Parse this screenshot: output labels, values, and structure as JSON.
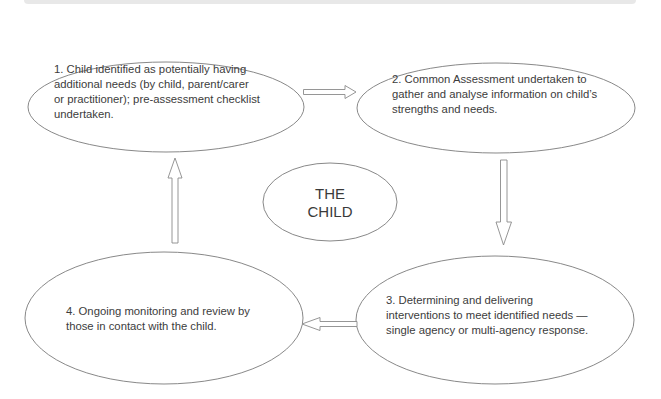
{
  "diagram": {
    "type": "cycle",
    "colors": {
      "stroke": "#7a7a7a",
      "arrow_stroke": "#8a8a8a",
      "text": "#3c3c3c",
      "top_bar": "#e4e4e4"
    },
    "center": {
      "line1": "THE",
      "line2": "CHILD"
    },
    "nodes": [
      {
        "id": 1,
        "lines": [
          "1. Child identified as potentially having",
          "additional needs (by child, parent/carer",
          "or practitioner); pre-assessment checklist",
          "undertaken."
        ]
      },
      {
        "id": 2,
        "lines": [
          "2. Common Assessment undertaken to",
          "gather and analyse information on child’s",
          "strengths and needs."
        ]
      },
      {
        "id": 3,
        "lines": [
          "3. Determining and delivering",
          "interventions to meet identified needs —",
          "single agency or multi-agency response."
        ]
      },
      {
        "id": 4,
        "lines": [
          "4. Ongoing monitoring and review by",
          "those in contact with the child."
        ]
      }
    ],
    "edges": [
      {
        "from": 1,
        "to": 2,
        "direction": "right"
      },
      {
        "from": 2,
        "to": 3,
        "direction": "down"
      },
      {
        "from": 3,
        "to": 4,
        "direction": "left"
      },
      {
        "from": 4,
        "to": 1,
        "direction": "up"
      }
    ]
  }
}
